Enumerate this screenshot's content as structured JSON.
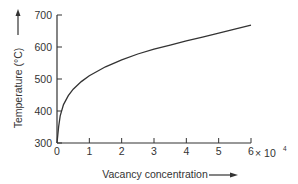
{
  "chart_data": {
    "type": "line",
    "title": "",
    "xlabel": "Vacancy concentration",
    "ylabel": "Temperature (°C)",
    "x_multiplier_label": "× 10",
    "x_multiplier_exponent": "4",
    "xlim": [
      0,
      6
    ],
    "ylim": [
      300,
      700
    ],
    "x_ticks": [
      0,
      1,
      2,
      3,
      4,
      5,
      6
    ],
    "y_ticks": [
      300,
      400,
      500,
      600,
      700
    ],
    "x_tick_labels": [
      "0",
      "1",
      "2",
      "3",
      "4",
      "5",
      "6"
    ],
    "y_tick_labels": [
      "300",
      "400",
      "500",
      "600",
      "700"
    ],
    "grid": false,
    "legend": null,
    "series": [
      {
        "name": "Temperature vs vacancy concentration",
        "x": [
          0,
          0.05,
          0.1,
          0.2,
          0.35,
          0.5,
          0.75,
          1,
          1.5,
          2,
          2.5,
          3,
          3.5,
          4,
          4.5,
          5,
          5.5,
          6
        ],
        "y": [
          300,
          350,
          385,
          420,
          448,
          468,
          492,
          510,
          538,
          560,
          578,
          593,
          606,
          619,
          631,
          643,
          656,
          668
        ]
      }
    ]
  },
  "axes": {
    "x_arrow": "right-arrow-icon",
    "y_arrow": "up-arrow-icon"
  },
  "colors": {
    "line": "#333333",
    "axis": "#333333",
    "text": "#333333",
    "background": "#ffffff"
  }
}
